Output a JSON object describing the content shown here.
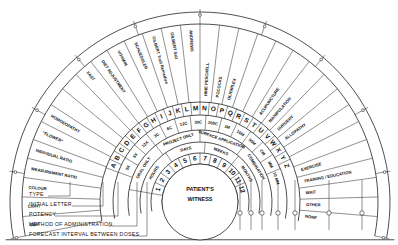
{
  "chart_title": "Radionic treatment chart",
  "center": {
    "line1": "PATIENT'S",
    "line2": "WITNESS"
  },
  "outer_ring_marks": [
    "0",
    "10",
    "20",
    "30",
    "40",
    "50",
    "60",
    "70",
    "80",
    "90",
    "100"
  ],
  "outer_ring_end_left": "0",
  "outer_ring_end_right": "0",
  "type_segments": [
    "GEM",
    "LIGHT",
    "COLOUR",
    "MEASUREMENT RATIO",
    "INDIVIDUAL RATIO",
    "\"FLOWER\"",
    "HOMOEOPATHY",
    "",
    "",
    "FAST",
    "DIET ADJUSTMENT",
    "VITAMIN",
    "SCHUESSLER",
    "GILBERT Trait Remedies",
    "GILBERT Salt",
    "ANDREWS",
    "HINE PESCHELL",
    "POCOCKS",
    "OLIGIPLEX",
    "",
    "",
    "ACUPUNCTURE",
    "MANIPULATION",
    "SURGERY",
    "ALLOPATHY",
    "",
    "",
    "EXERCISE",
    "TRAINING / EDUCATION",
    "WAIT",
    "OTHER",
    "NONE"
  ],
  "initial_letters": [
    "A",
    "B",
    "C",
    "D",
    "E",
    "F",
    "G",
    "H",
    "I",
    "J",
    "K",
    "L",
    "M",
    "N",
    "O",
    "P",
    "Q",
    "R",
    "S",
    "T",
    "U",
    "V",
    "W",
    "X",
    "Y",
    "Z"
  ],
  "potencies": [
    "3X",
    "6X",
    "12X",
    "3C",
    "6C",
    "12C",
    "30C",
    "200C",
    "1M",
    "10M",
    "50M",
    "CM",
    "MM",
    "10 MM"
  ],
  "methods": [
    "ORAL ONLY",
    "PROJECT ONLY",
    "SURFACE APPLICATION",
    "COMBINATION"
  ],
  "intervals": [
    "HOURS",
    "DAYS",
    "WEEKS",
    "MONTHS"
  ],
  "interval_numbers": [
    "1",
    "2",
    "3",
    "4",
    "5",
    "6",
    "7",
    "8",
    "9",
    "10",
    "11",
    "12"
  ],
  "legend": [
    "TYPE",
    "INITIAL LETTER",
    "POTENCY",
    "METHOD OF ADMINISTRATION",
    "FORECAST INTERVAL BETWEEN DOSES"
  ],
  "right_pointer_count": 7
}
